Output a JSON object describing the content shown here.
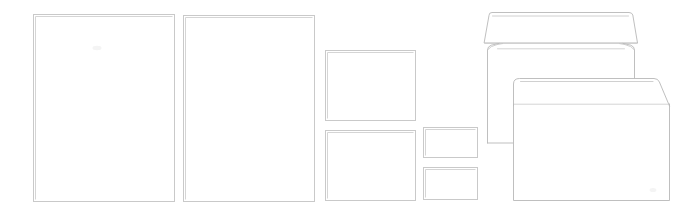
{
  "canvas": {
    "width": 685,
    "height": 215,
    "background": "#ffffff",
    "caption": "Line drawing comparison of paper sheet sizes and two window-less envelopes"
  },
  "palette": {
    "background": "#ffffff",
    "sheet_outline": "#c9c9c9",
    "sheet_outline_soft": "#d5d5d5",
    "envelope_outline": "#b8b8b8",
    "envelope_outline_thin": "#c4c4c4",
    "crease": "#c9c9c9",
    "smudge": "#f4f4f4"
  },
  "groups": [
    {
      "name": "large-sheets",
      "label": "Large portrait sheets",
      "count": 2
    },
    {
      "name": "medium-sheets",
      "label": "Medium landscape sheets",
      "count": 2
    },
    {
      "name": "small-sheets",
      "label": "Small landscape cards",
      "count": 2
    },
    {
      "name": "envelopes",
      "label": "Envelopes",
      "count": 2
    }
  ],
  "sheets": [
    {
      "id": "sheet-large-left",
      "label": "Large portrait sheet, left",
      "orientation": "portrait",
      "x": 33,
      "y": 14,
      "width": 142,
      "height": 188
    },
    {
      "id": "sheet-large-right",
      "label": "Large portrait sheet, right",
      "orientation": "portrait",
      "x": 183,
      "y": 15,
      "width": 132,
      "height": 187
    },
    {
      "id": "sheet-medium-top",
      "label": "Medium landscape sheet, top",
      "orientation": "landscape",
      "x": 325,
      "y": 50,
      "width": 91,
      "height": 71
    },
    {
      "id": "sheet-medium-bottom",
      "label": "Medium landscape sheet, bottom",
      "orientation": "landscape",
      "x": 325,
      "y": 130,
      "width": 91,
      "height": 71
    },
    {
      "id": "sheet-small-top",
      "label": "Small landscape card, top",
      "orientation": "landscape",
      "x": 423,
      "y": 127,
      "width": 55,
      "height": 31
    },
    {
      "id": "sheet-small-bottom",
      "label": "Small landscape card, bottom",
      "orientation": "landscape",
      "x": 423,
      "y": 167,
      "width": 55,
      "height": 33
    }
  ],
  "envelopes": [
    {
      "id": "envelope-back-open-flap",
      "label": "Long envelope with open flap, behind",
      "flap_state": "open",
      "x": 487,
      "y": 12,
      "width": 153,
      "height": 131
    },
    {
      "id": "envelope-front-pointed-flap",
      "label": "Wide envelope with closed pointed flap, in front",
      "flap_state": "closed",
      "x": 513,
      "y": 78,
      "width": 157,
      "height": 123
    }
  ]
}
